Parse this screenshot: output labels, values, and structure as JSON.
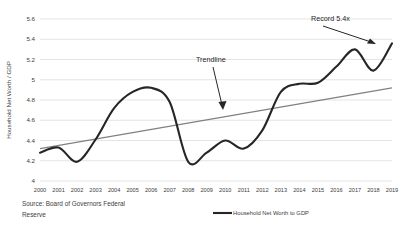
{
  "chart_data": {
    "type": "line",
    "title": "",
    "xlabel": "",
    "ylabel": "Household Net Worth / GDP",
    "ylim": [
      4,
      5.6
    ],
    "ytick_labels": [
      "4",
      "4.2",
      "4.4",
      "4.6",
      "4.8",
      "5",
      "5.2",
      "5.4",
      "5.6"
    ],
    "ytick_values": [
      4,
      4.2,
      4.4,
      4.6,
      4.8,
      5,
      5.2,
      5.4,
      5.6
    ],
    "grid": true,
    "legend_position": "bottom",
    "categories": [
      "2000",
      "2001",
      "2002",
      "2003",
      "2004",
      "2005",
      "2006",
      "2007",
      "2008",
      "2009",
      "2010",
      "2011",
      "2012",
      "2013",
      "2014",
      "2015",
      "2016",
      "2017",
      "2018",
      "2019"
    ],
    "series": [
      {
        "name": "Household Net Worth to GDP",
        "color": "#262626",
        "values": [
          4.28,
          4.33,
          4.19,
          4.41,
          4.72,
          4.88,
          4.92,
          4.78,
          4.19,
          4.28,
          4.4,
          4.32,
          4.5,
          4.88,
          4.96,
          4.97,
          5.13,
          5.3,
          5.09,
          5.36
        ]
      },
      {
        "name": "Trendline",
        "color": "#808080",
        "values": [
          4.32,
          4.355,
          4.389,
          4.423,
          4.458,
          4.492,
          4.526,
          4.561,
          4.595,
          4.629,
          4.663,
          4.698,
          4.732,
          4.766,
          4.801,
          4.835,
          4.869,
          4.904,
          4.938,
          4.92
        ]
      }
    ],
    "annotations": [
      {
        "text": "Record 5.4x",
        "target_category": "2019",
        "target_value": 5.36
      },
      {
        "text": "Trendline",
        "target_category": "2010",
        "target_value": 4.66
      }
    ]
  },
  "legend": {
    "entries": [
      {
        "label": "Household Net Worth to GDP",
        "color": "#262626"
      }
    ]
  },
  "source": {
    "line1": "Source: Board of Governors Federal",
    "line2": "Reserve"
  },
  "colors": {
    "series": "#262626",
    "trendline": "#808080",
    "grid": "#d9d9d9",
    "text": "#404040",
    "background": "#ffffff"
  }
}
